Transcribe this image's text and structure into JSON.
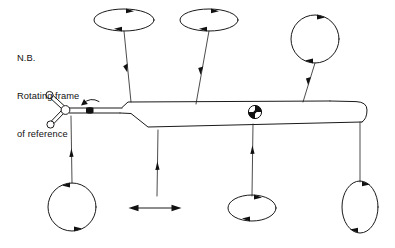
{
  "figure": {
    "title_note": {
      "lines": [
        "N.B.",
        "Rotating frame",
        "of reference"
      ]
    },
    "colors": {
      "stroke": "#1a1a1a",
      "background": "#ffffff",
      "text": "#111111"
    },
    "aircraft": {
      "name": "helicopter-airframe",
      "parts": [
        {
          "name": "main-rotor-hub",
          "label": ""
        },
        {
          "name": "main-rotor-blade-upper-left",
          "label": ""
        },
        {
          "name": "main-rotor-blade-lower-left",
          "label": ""
        },
        {
          "name": "rotor-mast",
          "label": ""
        },
        {
          "name": "fuselage",
          "label": ""
        },
        {
          "name": "tail-boom",
          "label": ""
        },
        {
          "name": "tail-tip",
          "label": ""
        },
        {
          "name": "center-of-gravity-marker",
          "label": ""
        }
      ]
    },
    "rotation_indicator": {
      "name": "rotor-rotation-arrow",
      "label": ""
    },
    "motion_indicators": [
      {
        "id": "mode-1",
        "name": "oscillation-ellipse-top-left",
        "shape": "ellipse",
        "orientation": "horizontal",
        "rx": 30,
        "ry": 11,
        "cx": 124,
        "cy": 20,
        "label": ""
      },
      {
        "id": "mode-2",
        "name": "oscillation-ellipse-top-middle",
        "shape": "ellipse",
        "orientation": "horizontal",
        "rx": 29,
        "ry": 11,
        "cx": 209,
        "cy": 20,
        "label": ""
      },
      {
        "id": "mode-3",
        "name": "oscillation-circle-top-right",
        "shape": "circle",
        "orientation": "circular",
        "rx": 24,
        "ry": 24,
        "cx": 315,
        "cy": 39,
        "label": ""
      },
      {
        "id": "mode-4",
        "name": "oscillation-circle-bottom-left",
        "shape": "circle",
        "orientation": "circular",
        "rx": 24,
        "ry": 24,
        "cx": 72,
        "cy": 207,
        "label": ""
      },
      {
        "id": "mode-5",
        "name": "oscillation-arrow-bottom-middle",
        "shape": "double-arrow",
        "orientation": "horizontal",
        "x1": 130,
        "x2": 180,
        "y": 208,
        "label": ""
      },
      {
        "id": "mode-6",
        "name": "oscillation-ellipse-bottom-right",
        "shape": "ellipse",
        "orientation": "horizontal",
        "rx": 24,
        "ry": 13,
        "cx": 252,
        "cy": 208,
        "label": ""
      },
      {
        "id": "mode-7",
        "name": "oscillation-ellipse-far-right",
        "shape": "ellipse",
        "orientation": "vertical",
        "rx": 18,
        "ry": 26,
        "cx": 360,
        "cy": 207,
        "label": ""
      }
    ],
    "leader_lines": [
      {
        "name": "leader-line-to-mode-1",
        "from": "mode-1",
        "to": "fuselage-forward"
      },
      {
        "name": "leader-line-to-mode-2",
        "from": "mode-2",
        "to": "fuselage-mid"
      },
      {
        "name": "leader-line-to-mode-3",
        "from": "mode-3",
        "to": "tail-boom"
      },
      {
        "name": "leader-line-to-mode-4",
        "from": "rotor-mast",
        "to": "mode-4"
      },
      {
        "name": "leader-line-to-mode-5",
        "from": "fuselage-belly",
        "to": "mode-5"
      },
      {
        "name": "leader-line-to-mode-6",
        "from": "fuselage-aft-belly",
        "to": "mode-6"
      },
      {
        "name": "leader-line-to-mode-7",
        "from": "tail-boom-underside",
        "to": "mode-7"
      }
    ]
  }
}
